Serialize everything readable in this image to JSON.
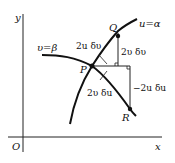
{
  "diagram": {
    "axes": {
      "origin_label": "O",
      "x_label": "x",
      "y_label": "y"
    },
    "curves": [
      {
        "name": "u-alpha-curve",
        "label": "u=α"
      },
      {
        "name": "v-beta-curve",
        "label": "υ=β"
      }
    ],
    "points": {
      "P": "P",
      "Q": "Q",
      "R": "R"
    },
    "annotations": {
      "pq_length": "2u δυ",
      "pr_length": "2υ δu",
      "q_vertical": "2υ δυ",
      "r_vertical": "−2u δu"
    }
  }
}
